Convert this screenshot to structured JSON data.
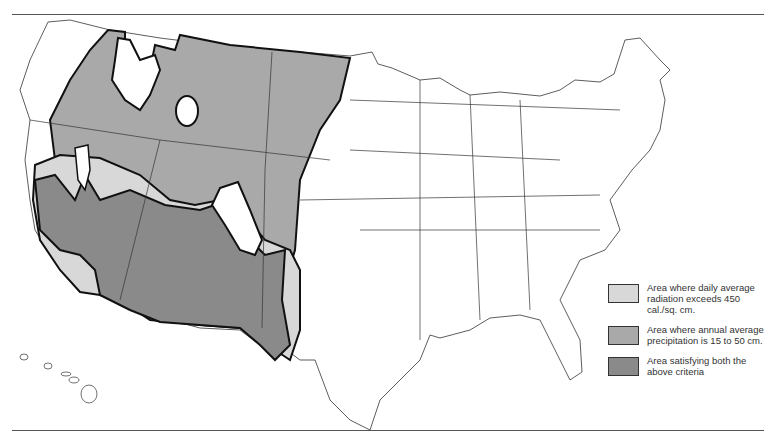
{
  "map": {
    "subject": "Contiguous United States with Alaska-less inset of Hawaii",
    "colors": {
      "radiation": "#d8d8d8",
      "precipitation": "#a9a9a9",
      "both": "#8a8a8a",
      "outline": "#111111",
      "state_lines": "#333333"
    }
  },
  "legend": {
    "items": [
      {
        "label": "Area where daily average radiation exceeds 450 cal./sq. cm.",
        "color": "#d8d8d8"
      },
      {
        "label": "Area where annual average precipitation is 15 to 50 cm.",
        "color": "#a9a9a9"
      },
      {
        "label": "Area satisfying both the above criteria",
        "color": "#8a8a8a"
      }
    ]
  }
}
